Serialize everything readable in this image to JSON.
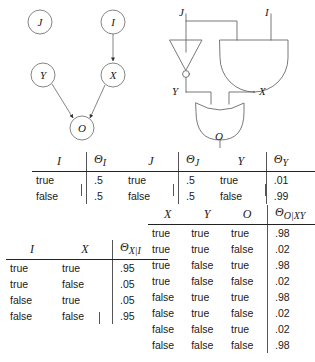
{
  "figure": {
    "caption": "",
    "bayesian_network": {
      "name": "bayesian-network",
      "nodes": [
        {
          "id": "J",
          "label": "J",
          "cx": 40,
          "cy": 22
        },
        {
          "id": "I",
          "label": "I",
          "cx": 113,
          "cy": 22
        },
        {
          "id": "Y",
          "label": "Y",
          "cx": 43,
          "cy": 75
        },
        {
          "id": "X",
          "label": "X",
          "cx": 113,
          "cy": 75
        },
        {
          "id": "O",
          "label": "O",
          "cx": 82,
          "cy": 128
        }
      ],
      "edges": [
        {
          "from": "I",
          "to": "X"
        },
        {
          "from": "Y",
          "to": "O"
        },
        {
          "from": "X",
          "to": "O"
        }
      ]
    },
    "circuit": {
      "name": "logic-circuit",
      "inputs": [
        "J",
        "I"
      ],
      "internal_labels": [
        "Y",
        "X"
      ],
      "output": "O",
      "gates": [
        {
          "type": "not-gate",
          "inputs": [
            "J"
          ],
          "output": "Y"
        },
        {
          "type": "and-gate",
          "inputs": [
            "J",
            "I"
          ],
          "output": "X"
        },
        {
          "type": "or-gate",
          "inputs": [
            "Y",
            "X"
          ],
          "output": "O"
        }
      ]
    }
  },
  "tables": {
    "theta_i": {
      "name": "cpt-theta-i",
      "headers": [
        "I",
        "Θ",
        "I"
      ],
      "var_header": "I",
      "prob_header_base": "Θ",
      "prob_header_sub": "I",
      "rows": [
        {
          "cells": [
            "true"
          ],
          "prob": ".5"
        },
        {
          "cells": [
            "false"
          ],
          "prob": ".5"
        }
      ]
    },
    "theta_j": {
      "name": "cpt-theta-j",
      "var_header": "J",
      "prob_header_base": "Θ",
      "prob_header_sub": "J",
      "rows": [
        {
          "cells": [
            "true"
          ],
          "prob": ".5"
        },
        {
          "cells": [
            "false"
          ],
          "prob": ".5"
        }
      ]
    },
    "theta_y": {
      "name": "cpt-theta-y",
      "var_header": "Y",
      "prob_header_base": "Θ",
      "prob_header_sub": "Y",
      "rows": [
        {
          "cells": [
            "true"
          ],
          "prob": ".01"
        },
        {
          "cells": [
            "false"
          ],
          "prob": ".99"
        }
      ]
    },
    "theta_x_given_i": {
      "name": "cpt-theta-x-given-i",
      "var_headers": [
        "I",
        "X"
      ],
      "prob_header_base": "Θ",
      "prob_header_sub": "X|I",
      "rows": [
        {
          "cells": [
            "true",
            "true"
          ],
          "prob": ".95"
        },
        {
          "cells": [
            "true",
            "false"
          ],
          "prob": ".05"
        },
        {
          "cells": [
            "false",
            "true"
          ],
          "prob": ".05"
        },
        {
          "cells": [
            "false",
            "false"
          ],
          "prob": ".95"
        }
      ]
    },
    "theta_o_given_xy": {
      "name": "cpt-theta-o-given-xy",
      "var_headers": [
        "X",
        "Y",
        "O"
      ],
      "prob_header_base": "Θ",
      "prob_header_sub": "O|XY",
      "rows": [
        {
          "cells": [
            "true",
            "true",
            "true"
          ],
          "prob": ".98"
        },
        {
          "cells": [
            "true",
            "true",
            "false"
          ],
          "prob": ".02"
        },
        {
          "cells": [
            "true",
            "false",
            "true"
          ],
          "prob": ".98"
        },
        {
          "cells": [
            "true",
            "false",
            "false"
          ],
          "prob": ".02"
        },
        {
          "cells": [
            "false",
            "true",
            "true"
          ],
          "prob": ".98"
        },
        {
          "cells": [
            "false",
            "true",
            "false"
          ],
          "prob": ".02"
        },
        {
          "cells": [
            "false",
            "false",
            "true"
          ],
          "prob": ".02"
        },
        {
          "cells": [
            "false",
            "false",
            "false"
          ],
          "prob": ".98"
        }
      ]
    }
  },
  "colors": {
    "ink": "#1a1a1a",
    "stroke": "#555555",
    "background": "#ffffff"
  }
}
